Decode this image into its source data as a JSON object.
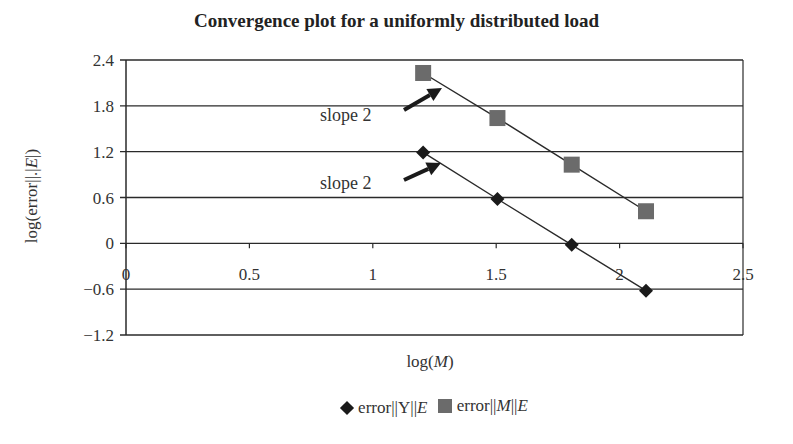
{
  "chart_data": {
    "type": "line",
    "title": "Convergence plot for a uniformly distributed load",
    "xlabel": "log(M)",
    "ylabel": "log(error||.|E|)",
    "xlim": [
      0,
      2.5
    ],
    "ylim": [
      -1.2,
      2.4
    ],
    "x_ticks": [
      "0",
      "0.5",
      "1",
      "1.5",
      "2",
      "2.5"
    ],
    "y_ticks": [
      "2.4",
      "1.8",
      "1.2",
      "0.6",
      "0",
      "-0.6",
      "-1.2"
    ],
    "grid": "horizontal",
    "legend_position": "bottom",
    "series": [
      {
        "name": "error||Y||E",
        "marker": "diamond",
        "color": "#1a1a1a",
        "x": [
          1.204,
          1.505,
          1.806,
          2.107
        ],
        "values": [
          1.19,
          0.58,
          -0.02,
          -0.62
        ]
      },
      {
        "name": "error||M||E",
        "marker": "square",
        "color": "#6b6b6b",
        "x": [
          1.204,
          1.505,
          1.806,
          2.107
        ],
        "values": [
          2.23,
          1.64,
          1.03,
          0.42
        ]
      }
    ],
    "annotations": [
      {
        "text": "slope 2",
        "series": "error||M||E"
      },
      {
        "text": "slope 2",
        "series": "error||Y||E"
      }
    ]
  },
  "title": "Convergence plot for a uniformly distributed load",
  "axes": {
    "x_label_prefix": "log(",
    "x_label_var": "M",
    "x_label_suffix": ")",
    "y_label_prefix": "log(error||.|",
    "y_label_var": "E",
    "y_label_suffix": "|)"
  },
  "legend": {
    "y_prefix": "error||Y||",
    "y_var": "E",
    "m_prefix": "error||",
    "m_var": "M",
    "m_mid": "||",
    "m_var2": "E"
  },
  "annotations": {
    "upper": "slope 2",
    "lower": "slope 2"
  }
}
